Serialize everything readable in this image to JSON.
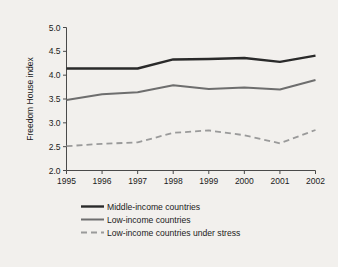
{
  "chart_data": {
    "type": "line",
    "title": "",
    "xlabel": "",
    "ylabel": "Freedom House index",
    "categories": [
      "1995",
      "1996",
      "1997",
      "1998",
      "1999",
      "2000",
      "2001",
      "2002"
    ],
    "x": [
      1995,
      1996,
      1997,
      1998,
      1999,
      2000,
      2001,
      2002
    ],
    "ylim": [
      2.0,
      5.0
    ],
    "yticks": [
      "2.0",
      "2.5",
      "3.0",
      "3.5",
      "4.0",
      "4.5",
      "5.0"
    ],
    "ytick_values": [
      2.0,
      2.5,
      3.0,
      3.5,
      4.0,
      4.5,
      5.0
    ],
    "grid": false,
    "legend_position": "below-axes",
    "series": [
      {
        "name": "Middle-income countries",
        "values": [
          4.14,
          4.14,
          4.14,
          4.33,
          4.34,
          4.36,
          4.28,
          4.41
        ],
        "color": "#2a2a2a",
        "style": "solid",
        "width": 2.4
      },
      {
        "name": "Low-income countries",
        "values": [
          3.48,
          3.6,
          3.64,
          3.79,
          3.71,
          3.74,
          3.7,
          3.9
        ],
        "color": "#6e6e6e",
        "style": "solid",
        "width": 2.0
      },
      {
        "name": "Low-income countries under stress",
        "values": [
          2.51,
          2.56,
          2.59,
          2.79,
          2.84,
          2.74,
          2.57,
          2.85
        ],
        "color": "#9a9a9a",
        "style": "dashed",
        "width": 1.8
      }
    ]
  },
  "legend": {
    "items": [
      {
        "label": "Middle-income countries"
      },
      {
        "label": "Low-income countries"
      },
      {
        "label": "Low-income countries under stress"
      }
    ]
  },
  "colors": {
    "background": "#f2f0ed",
    "axis": "#4a4a4a",
    "text": "#1b1b1b",
    "series_middle_income": "#2a2a2a",
    "series_low_income": "#6e6e6e",
    "series_low_income_stress": "#9a9a9a"
  }
}
